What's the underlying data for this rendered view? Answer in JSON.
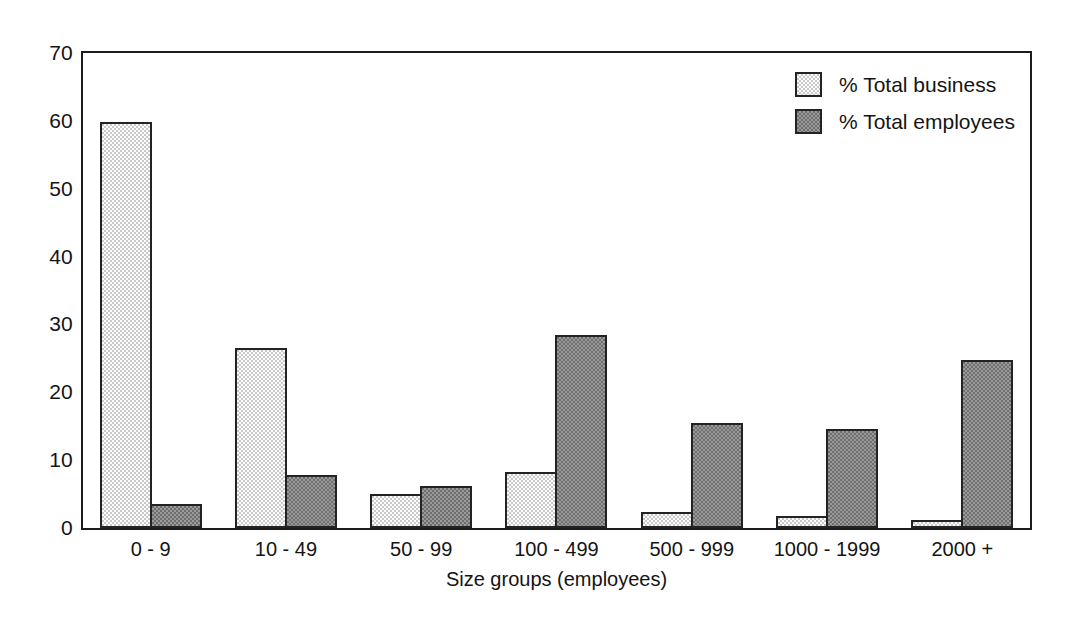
{
  "chart_data": {
    "type": "bar",
    "title": "",
    "subtitle": "",
    "xlabel": "Size groups (employees)",
    "ylabel": "",
    "categories": [
      "0 - 9",
      "10 - 49",
      "50 - 99",
      "100 - 499",
      "500 - 999",
      "1000 - 1999",
      "2000 +"
    ],
    "series": [
      {
        "name": "% Total business",
        "color": "#c9c9c9",
        "values": [
          59.8,
          26.5,
          5.0,
          8.2,
          2.3,
          1.7,
          1.2
        ]
      },
      {
        "name": "% Total employees",
        "color": "#6f6f6f",
        "values": [
          3.5,
          7.8,
          6.2,
          28.4,
          15.5,
          14.6,
          24.8
        ]
      }
    ],
    "ylim": [
      0,
      70
    ],
    "yticks": [
      0,
      10,
      20,
      30,
      40,
      50,
      60,
      70
    ],
    "ytick_labels": [
      "0",
      "10",
      "20",
      "30",
      "40",
      "50",
      "60",
      "70"
    ],
    "grid": false,
    "legend_position": "top-right",
    "frame": true,
    "bar_border_color": "#232323"
  },
  "legend": {
    "items": [
      {
        "label": "% Total business"
      },
      {
        "label": "% Total employees"
      }
    ]
  },
  "axes": {
    "x_title": "Size groups (employees)"
  }
}
